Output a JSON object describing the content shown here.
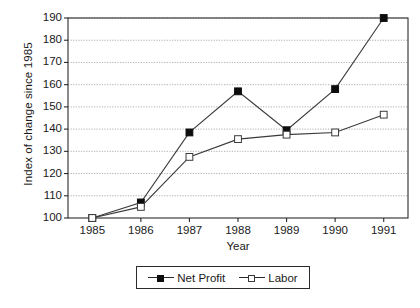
{
  "chart_data": {
    "type": "line",
    "title": "",
    "xlabel": "Year",
    "ylabel": "Index of change since 1985",
    "categories": [
      "1985",
      "1986",
      "1987",
      "1988",
      "1989",
      "1990",
      "1991"
    ],
    "series": [
      {
        "name": "Net Profit",
        "marker": "filled-square",
        "color": "#0d0d0d",
        "values": [
          100,
          107,
          138.5,
          157,
          139.5,
          158,
          190
        ]
      },
      {
        "name": "Labor",
        "marker": "open-square",
        "color": "#3a3a3a",
        "values": [
          100,
          105,
          127.5,
          135.5,
          137.5,
          138.5,
          146.5
        ]
      }
    ],
    "ylim": [
      100,
      190
    ],
    "yticks": [
      100,
      110,
      120,
      130,
      140,
      150,
      160,
      170,
      180,
      190
    ],
    "ytick_labels": [
      "100",
      "110",
      "120",
      "130",
      "140",
      "150",
      "160",
      "170",
      "180",
      "190"
    ],
    "grid": true,
    "grid_style": "dotted-horizontal",
    "legend_position": "bottom-center",
    "legend_entries": [
      "Net Profit",
      "Labor"
    ],
    "axis_color": "#2b2b2b",
    "grid_color": "#9a9a9a",
    "background": "#ffffff"
  }
}
